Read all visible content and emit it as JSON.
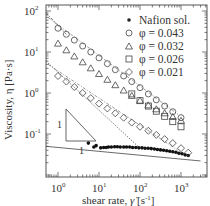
{
  "chart_data": {
    "type": "scatter",
    "title": "",
    "xlabel": "shear rate, γ̇ [s⁻¹]",
    "ylabel": "Viscosity, η [Pa·s]",
    "xscale": "log",
    "yscale": "log",
    "xlim": [
      0.4,
      3000
    ],
    "ylim": [
      0.015,
      130
    ],
    "xticks": [
      1,
      10,
      100,
      1000
    ],
    "xtick_labels": [
      "10^0",
      "10^1",
      "10^2",
      "10^3"
    ],
    "yticks": [
      0.1,
      1,
      10,
      100
    ],
    "ytick_labels": [
      "10^-1",
      "10^0",
      "10^1",
      "10^2"
    ],
    "grid": false,
    "legend_position": "upper right",
    "series": [
      {
        "name": "Nafion sol.",
        "marker": "filled-circle",
        "x": [
          5.5,
          7.5,
          8.5,
          11,
          13,
          15,
          17,
          20,
          24,
          28,
          33,
          40,
          47,
          56,
          66,
          79,
          94,
          112,
          133,
          158,
          188,
          224,
          266,
          316,
          376,
          447,
          531,
          631,
          750,
          891,
          1060,
          1260,
          1500
        ],
        "y": [
          0.06,
          0.048,
          0.052,
          0.046,
          0.047,
          0.047,
          0.048,
          0.048,
          0.049,
          0.049,
          0.048,
          0.048,
          0.048,
          0.048,
          0.047,
          0.047,
          0.046,
          0.046,
          0.045,
          0.045,
          0.044,
          0.043,
          0.042,
          0.041,
          0.04,
          0.039,
          0.038,
          0.037,
          0.036,
          0.034,
          0.033,
          0.031,
          0.03
        ],
        "fit_line": {
          "style": "solid",
          "x": [
            0.4,
            3000
          ],
          "y": [
            0.05,
            0.022
          ]
        }
      },
      {
        "name": "φ = 0.043",
        "marker": "open-circle",
        "x": [
          1.0,
          1.6,
          2.5,
          4.0,
          6.3,
          10,
          16,
          25,
          40,
          63,
          100,
          160,
          250,
          400,
          630,
          1000
        ],
        "y": [
          38,
          27,
          19.5,
          14,
          10,
          7.2,
          5.2,
          3.7,
          2.6,
          1.9,
          1.35,
          0.95,
          0.68,
          0.48,
          0.35,
          0.25
        ],
        "fit_line": {
          "style": "dash-dot",
          "x": [
            0.4,
            1.6
          ],
          "y": [
            90,
            27
          ]
        }
      },
      {
        "name": "φ = 0.032",
        "marker": "open-triangle",
        "x": [
          1.0,
          1.6,
          2.5,
          4.0,
          6.3,
          10,
          16,
          25,
          40,
          63,
          100,
          160,
          250,
          400,
          630,
          1000
        ],
        "y": [
          16,
          11,
          7.8,
          5.6,
          4.0,
          2.9,
          2.1,
          1.55,
          1.15,
          0.85,
          0.65,
          0.5,
          0.4,
          0.32,
          0.26,
          0.21
        ]
      },
      {
        "name": "φ = 0.026",
        "marker": "open-square",
        "x": [
          63,
          100,
          160,
          250,
          400,
          630,
          1000
        ],
        "y": [
          0.95,
          0.65,
          0.48,
          0.36,
          0.27,
          0.2,
          0.15
        ]
      },
      {
        "name": "φ = 0.021",
        "marker": "open-diamond",
        "x": [
          1.0,
          1.6,
          2.5,
          4.0,
          6.3,
          10,
          16,
          25,
          40,
          63,
          100,
          160,
          250,
          400,
          630,
          1000,
          1500
        ],
        "y": [
          2.6,
          1.9,
          1.4,
          1.0,
          0.75,
          0.55,
          0.42,
          0.32,
          0.25,
          0.19,
          0.15,
          0.12,
          0.095,
          0.075,
          0.06,
          0.045,
          0.035
        ],
        "fit_line": {
          "style": "dotted",
          "x": [
            0.4,
            100
          ],
          "y": [
            6.0,
            0.045
          ]
        }
      }
    ],
    "annotations": [
      {
        "type": "slope-triangle",
        "label_vertical": "1",
        "label_horizontal": "1",
        "slope": -1
      }
    ]
  },
  "legend": {
    "items": [
      {
        "label": "Nafion sol.",
        "marker": "filled-circle"
      },
      {
        "label": "φ = 0.043",
        "marker": "open-circle"
      },
      {
        "label": "φ = 0.032",
        "marker": "open-triangle"
      },
      {
        "label": "φ = 0.026",
        "marker": "open-square"
      },
      {
        "label": "φ = 0.021",
        "marker": "open-diamond"
      }
    ]
  },
  "axes": {
    "xlabel_text": "shear rate, ",
    "xlabel_symbol": "γ̇",
    "xlabel_units": " [s",
    "xlabel_units_exp": "-1",
    "xlabel_units_close": "]",
    "ylabel_text": "Viscosity, η [Pa·s]",
    "xticks": [
      {
        "base": "10",
        "exp": "0"
      },
      {
        "base": "10",
        "exp": "1"
      },
      {
        "base": "10",
        "exp": "2"
      },
      {
        "base": "10",
        "exp": "3"
      }
    ],
    "yticks": [
      {
        "base": "10",
        "exp": "2"
      },
      {
        "base": "10",
        "exp": "1"
      },
      {
        "base": "10",
        "exp": "0"
      },
      {
        "base": "10",
        "exp": "-1"
      }
    ]
  },
  "slope_triangle": {
    "vertical_label": "1",
    "horizontal_label": "1"
  },
  "colors": {
    "ink": "#333333",
    "background": "#ffffff"
  }
}
